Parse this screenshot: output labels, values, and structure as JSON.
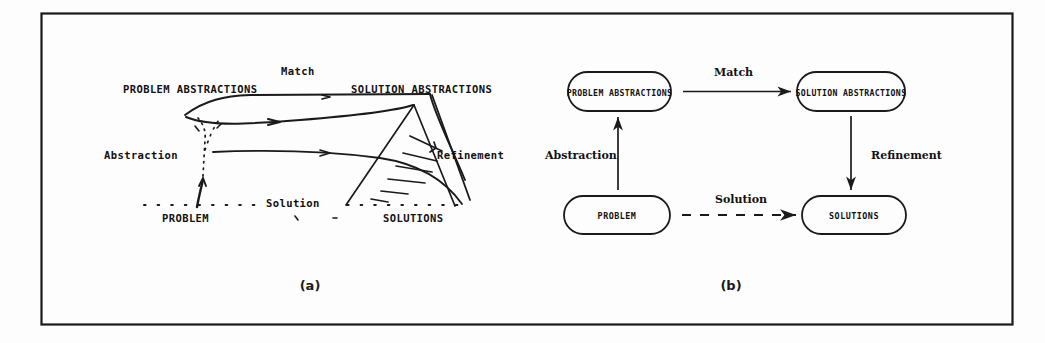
{
  "figure": {
    "border_color": "#1a1a1a",
    "ink_color": "#111111",
    "captions": {
      "left": "(a)",
      "right": "(b)"
    },
    "panel_a": {
      "name": "freehand-landscape-diagram",
      "labels": {
        "problem_abstractions": "PROBLEM ABSTRACTIONS",
        "solution_abstractions": "SOLUTION ABSTRACTIONS",
        "problem": "PROBLEM",
        "solutions": "SOLUTIONS",
        "match": "Match",
        "abstraction": "Abstraction",
        "solution": "Solution",
        "refinement": "Refinement"
      }
    },
    "panel_b": {
      "name": "boxed-flow-diagram",
      "nodes": [
        {
          "id": "problem-abstractions",
          "label": "PROBLEM ABSTRACTIONS"
        },
        {
          "id": "solution-abstractions",
          "label": "SOLUTION ABSTRACTIONS"
        },
        {
          "id": "problem",
          "label": "PROBLEM"
        },
        {
          "id": "solutions",
          "label": "SOLUTIONS"
        }
      ],
      "edges": [
        {
          "id": "match",
          "label": "Match",
          "style": "solid",
          "from": "problem-abstractions",
          "to": "solution-abstractions"
        },
        {
          "id": "abstraction",
          "label": "Abstraction",
          "style": "solid",
          "from": "problem",
          "to": "problem-abstractions"
        },
        {
          "id": "refinement",
          "label": "Refinement",
          "style": "solid",
          "from": "solution-abstractions",
          "to": "solutions"
        },
        {
          "id": "solution",
          "label": "Solution",
          "style": "dashed",
          "from": "problem",
          "to": "solutions"
        }
      ]
    }
  }
}
